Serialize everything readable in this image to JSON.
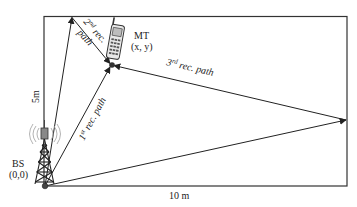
{
  "diagram": {
    "room": {
      "width_label": "10 m",
      "height_label": "5m",
      "stroke_color": "#333333"
    },
    "base_station": {
      "label": "BS",
      "coords": "(0,0)",
      "icon": "radio-tower-icon"
    },
    "mobile_terminal": {
      "label": "MT",
      "coords": "(x, y)",
      "icon": "mobile-phone-icon"
    },
    "paths": [
      {
        "ordinal": "1",
        "suffix": "st",
        "text": " rec. path"
      },
      {
        "ordinal": "2",
        "suffix": "nd",
        "text_line1": " rec.",
        "text_line2": "path"
      },
      {
        "ordinal": "3",
        "suffix": "rd",
        "text": " rec. path"
      }
    ],
    "line_color": "#222222",
    "signal_wave_color": "#aaaaaa"
  }
}
